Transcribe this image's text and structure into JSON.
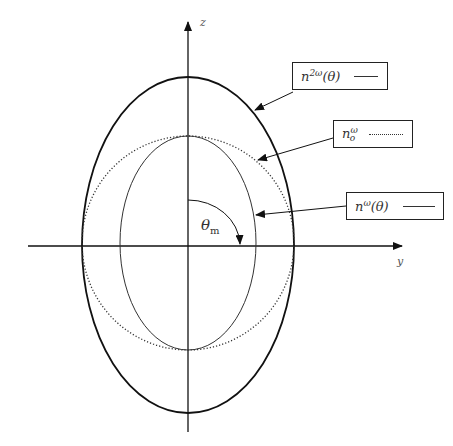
{
  "axes": {
    "vertical_label": "z",
    "horizontal_label": "y"
  },
  "angle": {
    "symbol": "θ",
    "subscript": "m"
  },
  "legend": [
    {
      "base": "n",
      "sup": "2ω",
      "arg": "(θ)",
      "line_style": "solid-thick"
    },
    {
      "base": "n",
      "sup": "ω",
      "sub": "o",
      "arg": "",
      "line_style": "dotted"
    },
    {
      "base": "n",
      "sup": "ω",
      "arg": "(θ)",
      "line_style": "solid-thin"
    }
  ],
  "curves": [
    {
      "name": "n2omega-theta-ellipse",
      "style": "solid-thick",
      "center": [
        188,
        246
      ],
      "rx": 107,
      "ry": 168
    },
    {
      "name": "n-omega-o-circle",
      "style": "dotted",
      "center": [
        188,
        244
      ],
      "rx": 107,
      "ry": 107
    },
    {
      "name": "n-omega-theta-ellipse",
      "style": "solid-thin",
      "center": [
        188,
        244
      ],
      "rx": 68,
      "ry": 107
    }
  ],
  "colors": {
    "line": "#1a1a1a",
    "background": "#ffffff"
  }
}
